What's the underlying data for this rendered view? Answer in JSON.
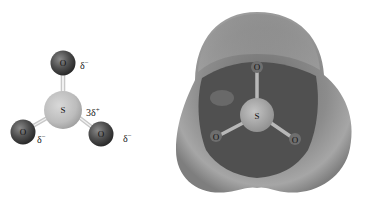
{
  "ball_stick_model": {
    "molecule": "SO3",
    "atoms": [
      {
        "symbol": "O",
        "position": "top",
        "charge_label": "δ",
        "charge_sign": "−"
      },
      {
        "symbol": "S",
        "position": "center",
        "charge_label": "3δ",
        "charge_sign": "+"
      },
      {
        "symbol": "O",
        "position": "bottom-left",
        "charge_label": "δ",
        "charge_sign": "−"
      },
      {
        "symbol": "O",
        "position": "bottom-right",
        "charge_label": "δ",
        "charge_sign": "−"
      }
    ]
  },
  "electrostatic_potential_map": {
    "molecule": "SO3",
    "atoms": [
      {
        "symbol": "O",
        "position": "top"
      },
      {
        "symbol": "S",
        "position": "center"
      },
      {
        "symbol": "O",
        "position": "bottom-left"
      },
      {
        "symbol": "O",
        "position": "bottom-right"
      }
    ]
  },
  "colors": {
    "oxygen": "#4a4a4a",
    "sulfur": "#bdbdbd",
    "surface_outer": "#9a9a9a",
    "surface_inner": "#4e4e4e",
    "background": "#ffffff"
  }
}
